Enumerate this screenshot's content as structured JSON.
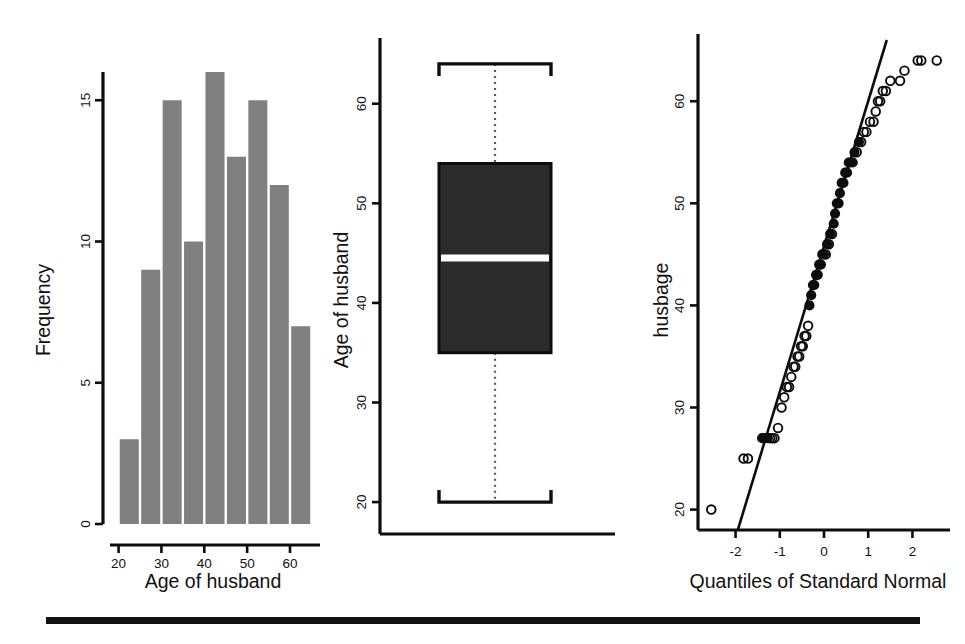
{
  "figure": {
    "panels": [
      "histogram",
      "boxplot",
      "qqplot"
    ],
    "bottom_rule": "horizontal-rule"
  },
  "chart_data": [
    {
      "type": "bar",
      "panel": "histogram",
      "title": "",
      "xlabel": "Age of husband",
      "ylabel": "Frequency",
      "xlim": [
        18,
        67
      ],
      "ylim": [
        0,
        16
      ],
      "xticks": [
        20,
        30,
        40,
        50,
        60
      ],
      "yticks": [
        0,
        5,
        10,
        15
      ],
      "grid": false,
      "bin_width": 5,
      "bin_starts": [
        20,
        25,
        30,
        35,
        40,
        45,
        50,
        55,
        60
      ],
      "categories": [
        "20-25",
        "25-30",
        "30-35",
        "35-40",
        "40-45",
        "45-50",
        "50-55",
        "55-60",
        "60-65"
      ],
      "values": [
        3,
        9,
        15,
        10,
        16,
        13,
        15,
        12,
        7
      ],
      "bar_color": "#808080"
    },
    {
      "type": "box",
      "panel": "boxplot",
      "title": "",
      "xlabel": "",
      "ylabel": "Age of husband",
      "ylim": [
        18,
        66
      ],
      "yticks": [
        20,
        30,
        40,
        50,
        60
      ],
      "grid": false,
      "stats": {
        "min_whisker": 20,
        "q1": 35,
        "median": 44.5,
        "q3": 54,
        "max_whisker": 64
      },
      "box_color": "#2b2b2b",
      "median_color": "#ffffff"
    },
    {
      "type": "scatter",
      "panel": "qqplot",
      "title": "",
      "xlabel": "Quantiles of Standard Normal",
      "ylabel": "husbage",
      "xlim": [
        -2.85,
        2.85
      ],
      "ylim": [
        18,
        66
      ],
      "xticks": [
        -2,
        -1,
        0,
        1,
        2
      ],
      "yticks": [
        20,
        30,
        40,
        50,
        60
      ],
      "grid": false,
      "reference_line": {
        "x": [
          -1.95,
          1.42
        ],
        "y": [
          18,
          66
        ]
      },
      "x": [
        -2.55,
        -1.82,
        -1.72,
        -1.4,
        -1.33,
        -1.27,
        -1.22,
        -1.17,
        -1.12,
        -1.04,
        -0.96,
        -0.9,
        -0.84,
        -0.79,
        -0.74,
        -0.69,
        -0.65,
        -0.6,
        -0.56,
        -0.52,
        -0.48,
        -0.44,
        -0.4,
        -0.36,
        -0.33,
        -0.29,
        -0.25,
        -0.22,
        -0.18,
        -0.14,
        -0.11,
        -0.07,
        -0.04,
        0.0,
        0.04,
        0.07,
        0.11,
        0.14,
        0.18,
        0.22,
        0.25,
        0.29,
        0.33,
        0.36,
        0.4,
        0.44,
        0.48,
        0.52,
        0.56,
        0.6,
        0.65,
        0.69,
        0.74,
        0.79,
        0.84,
        0.9,
        0.96,
        1.04,
        1.12,
        1.17,
        1.22,
        1.27,
        1.33,
        1.4,
        1.5,
        1.72,
        1.82,
        2.12,
        2.2,
        2.55
      ],
      "y": [
        20,
        25,
        25,
        27,
        27,
        27,
        27,
        27,
        27,
        28,
        30,
        31,
        32,
        32,
        33,
        34,
        34,
        35,
        35,
        36,
        36,
        37,
        37,
        38,
        40,
        41,
        42,
        42,
        43,
        43,
        44,
        44,
        45,
        45,
        45,
        46,
        46,
        47,
        47,
        48,
        49,
        50,
        50,
        51,
        52,
        52,
        53,
        53,
        54,
        54,
        54,
        55,
        55,
        56,
        56,
        57,
        57,
        58,
        58,
        59,
        60,
        60,
        61,
        61,
        62,
        62,
        63,
        64,
        64,
        64
      ],
      "marker": "open-circle"
    }
  ],
  "histogram": {
    "ylabel": "Frequency",
    "xlabel": "Age of husband",
    "xticks": [
      "20",
      "30",
      "40",
      "50",
      "60"
    ],
    "yticks": [
      "0",
      "5",
      "10",
      "15"
    ]
  },
  "boxplot": {
    "ylabel": "Age of husband",
    "yticks": [
      "20",
      "30",
      "40",
      "50",
      "60"
    ]
  },
  "qqplot": {
    "ylabel": "husbage",
    "xlabel": "Quantiles of Standard Normal",
    "xticks": [
      "-2",
      "-1",
      "0",
      "1",
      "2"
    ],
    "yticks": [
      "20",
      "30",
      "40",
      "50",
      "60"
    ]
  }
}
